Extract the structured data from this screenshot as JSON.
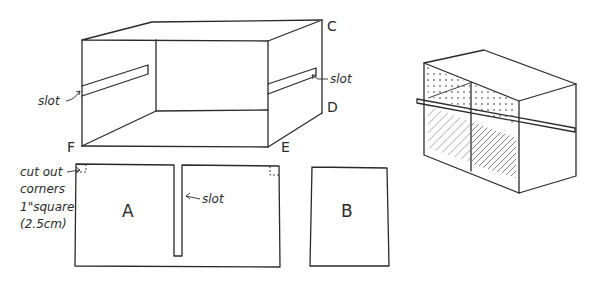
{
  "box_drawing": {
    "corner_labels": {
      "C": "C",
      "D": "D",
      "E": "E",
      "F": "F"
    },
    "slot_left_label": "slot",
    "slot_right_label": "slot"
  },
  "panel_a": {
    "label": "A",
    "slot_label": "slot",
    "note_lines": [
      "cut out",
      "corners",
      "1\"square",
      "(2.5cm)"
    ]
  },
  "panel_b": {
    "label": "B"
  },
  "assembled_view": {
    "description": "assembled box with divider panels"
  }
}
